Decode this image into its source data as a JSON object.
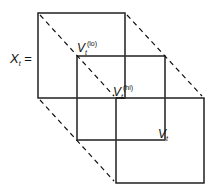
{
  "diagram": {
    "equation_lhs": {
      "symbol": "X",
      "subscript": "t",
      "suffix": " ="
    },
    "labels": [
      {
        "symbol": "V",
        "subscript": "t",
        "superscript": "(lo)"
      },
      {
        "symbol": "V",
        "subscript": "t",
        "superscript": "(hi)"
      },
      {
        "symbol": "V",
        "subscript": "t",
        "superscript": ""
      }
    ],
    "squares": [
      {
        "name": "back-square",
        "x": 38,
        "y": 13,
        "w": 87,
        "h": 85
      },
      {
        "name": "middle-square",
        "x": 77,
        "y": 56,
        "w": 88,
        "h": 84
      },
      {
        "name": "front-square",
        "x": 116,
        "y": 98,
        "w": 88,
        "h": 85
      }
    ],
    "colors": {
      "line": "#111111",
      "thin_line": "#555555"
    }
  }
}
